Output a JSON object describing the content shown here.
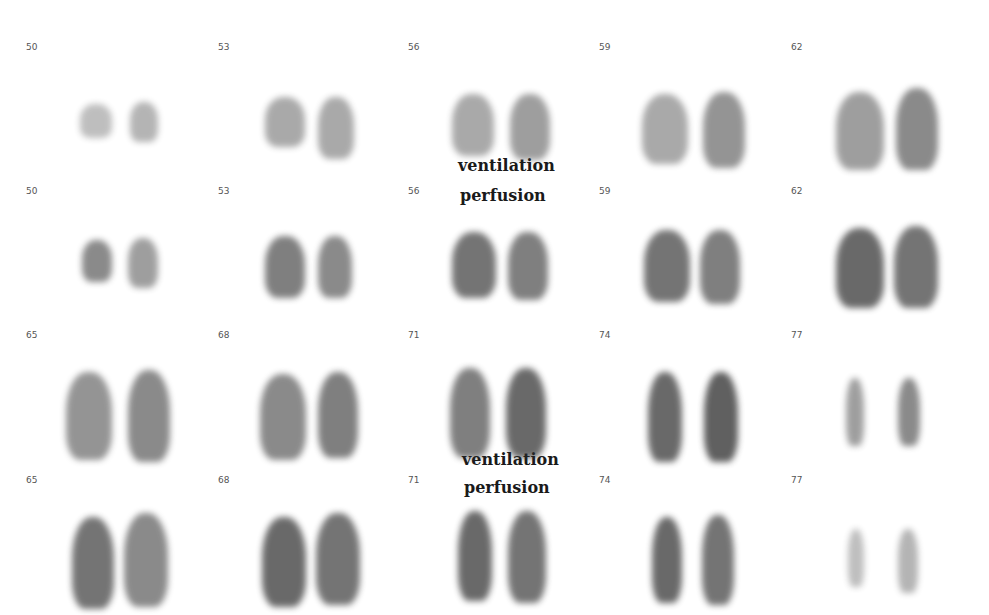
{
  "figure": {
    "captions": {
      "top_ventilation": "ventilation",
      "top_perfusion": "perfusion",
      "bottom_ventilation": "ventilation",
      "bottom_perfusion": "perfusion"
    },
    "rows": [
      {
        "type": "ventilation",
        "slices": [
          "50",
          "53",
          "56",
          "59",
          "62"
        ]
      },
      {
        "type": "perfusion",
        "slices": [
          "50",
          "53",
          "56",
          "59",
          "62"
        ]
      },
      {
        "type": "ventilation",
        "slices": [
          "65",
          "68",
          "71",
          "74",
          "77"
        ]
      },
      {
        "type": "perfusion",
        "slices": [
          "65",
          "68",
          "71",
          "74",
          "77"
        ]
      }
    ],
    "colors": {
      "background": "#ffffff",
      "uptake": "#2b2b2b",
      "label": "#555555"
    }
  }
}
